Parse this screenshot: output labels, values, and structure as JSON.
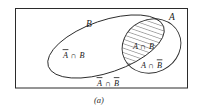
{
  "figure": {
    "caption": "(a)",
    "type": "venn-diagram",
    "universe_label": "",
    "sets": [
      {
        "id": "A",
        "label": "A"
      },
      {
        "id": "B",
        "label": "B"
      }
    ],
    "regions": [
      {
        "id": "a-not-b",
        "label": "A ∩ B",
        "label_head": "A",
        "op": "∩",
        "label_tail": "B",
        "shaded": false
      },
      {
        "id": "a-and-b",
        "label": "A ∩ B",
        "shaded": true
      },
      {
        "id": "not-a-and-b",
        "label": "A ∩ B",
        "shaded": false
      },
      {
        "id": "not-a-not-b",
        "label": "A ∩ B",
        "shaded": false
      }
    ],
    "text": {
      "set_a": "A",
      "set_b": "B",
      "not_a_and_b_a": "A",
      "not_a_and_b_op": "∩",
      "not_a_and_b_b": "B",
      "a_and_b_a": "A",
      "a_and_b_op": "∩",
      "a_and_b_b": "B",
      "a_and_not_b_a": "A",
      "a_and_not_b_op": "∩",
      "a_and_not_b_b": "B",
      "not_a_and_not_b_a": "A",
      "not_a_and_not_b_op": "∩",
      "not_a_and_not_b_b": "B"
    }
  },
  "colors": {
    "ink": "#2b2b2b",
    "text": "#1a1a1a",
    "background": "#ffffff",
    "hatch": "#3a3a3a"
  }
}
